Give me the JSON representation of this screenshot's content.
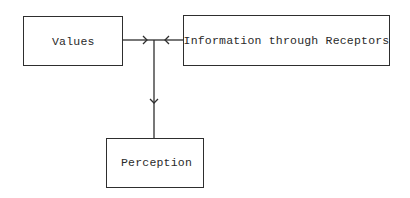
{
  "diagram": {
    "nodes": [
      {
        "id": "values",
        "label": "Values"
      },
      {
        "id": "information",
        "label": "Information through Receptors"
      },
      {
        "id": "perception",
        "label": "Perception"
      }
    ],
    "edges": [
      {
        "from": "values",
        "to": "junction"
      },
      {
        "from": "information",
        "to": "junction"
      },
      {
        "from": "junction",
        "to": "perception"
      }
    ],
    "colors": {
      "line": "#2e2e2e",
      "background": "#ffffff"
    }
  }
}
